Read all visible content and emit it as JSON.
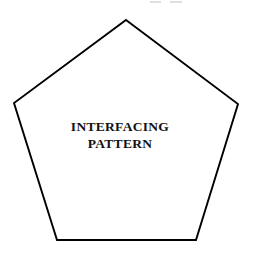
{
  "figure": {
    "title": "Interfacing Pattern",
    "background_color": "#ffffff",
    "stroke_color": "#000000",
    "text_color": "#111111",
    "shape": {
      "name": "pentagon",
      "sides": 5,
      "fill": "#ffffff",
      "stroke_width": 1.9,
      "points": "126,20 238,104 196,240 57,240 14,103",
      "vertices": [
        {
          "label": "apex",
          "x": 126,
          "y": 20
        },
        {
          "label": "right",
          "x": 238,
          "y": 104
        },
        {
          "label": "bottom-right",
          "x": 196,
          "y": 240
        },
        {
          "label": "bottom-left",
          "x": 57,
          "y": 240
        },
        {
          "label": "left",
          "x": 14,
          "y": 103
        }
      ]
    },
    "label": {
      "line1": "INTERFACING",
      "line2": "PATTERN"
    }
  }
}
